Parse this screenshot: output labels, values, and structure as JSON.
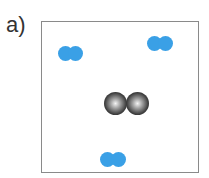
{
  "panel": {
    "label": "a)"
  },
  "molecules": [
    {
      "type": "diatomic",
      "color": "#3aa0e6",
      "atoms": [
        {
          "x": 58,
          "y": 46
        },
        {
          "x": 68,
          "y": 46
        }
      ]
    },
    {
      "type": "diatomic",
      "color": "#3aa0e6",
      "atoms": [
        {
          "x": 147,
          "y": 36
        },
        {
          "x": 158,
          "y": 36
        }
      ]
    },
    {
      "type": "diatomic",
      "color": "#3aa0e6",
      "atoms": [
        {
          "x": 100,
          "y": 152
        },
        {
          "x": 111,
          "y": 152
        }
      ]
    },
    {
      "type": "diatomic",
      "color": "#222222",
      "atoms": [
        {
          "x": 104,
          "y": 92
        },
        {
          "x": 126,
          "y": 92
        }
      ]
    }
  ]
}
